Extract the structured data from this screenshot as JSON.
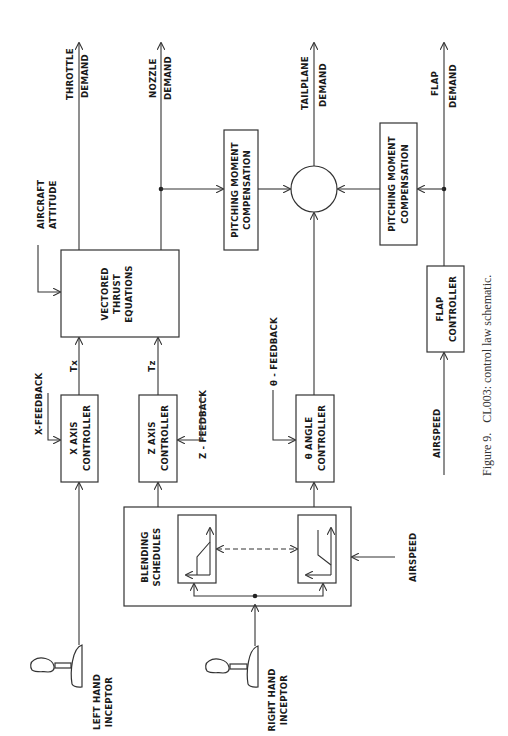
{
  "figure": {
    "caption_number": "Figure 9.",
    "caption_text": "CL003: control law schematic.",
    "orientation": "rotated 90 degrees counter-clockwise"
  },
  "outputs": {
    "throttle": [
      "THROTTLE",
      "DEMAND"
    ],
    "nozzle": [
      "NOZZLE",
      "DEMAND"
    ],
    "tailplane": [
      "TAILPLANE",
      "DEMAND"
    ],
    "flap": [
      "FLAP",
      "DEMAND"
    ]
  },
  "inputs": {
    "aircraft_attitude": [
      "AIRCRAFT",
      "ATTITUDE"
    ],
    "x_feedback": "X-FEEDBACK",
    "z_feedback": "Z - FEEDBACK",
    "theta_feedback": "θ - FEEDBACK",
    "airspeed_blending": "AIRSPEED",
    "airspeed_flap": "AIRSPEED",
    "left_inceptor": [
      "LEFT HAND",
      "INCEPTOR"
    ],
    "right_inceptor": [
      "RIGHT HAND",
      "INCEPTOR"
    ]
  },
  "blocks": {
    "vectored_thrust": [
      "VECTORED",
      "THRUST",
      "EQUATIONS"
    ],
    "x_axis": [
      "X  AXIS",
      "CONTROLLER"
    ],
    "z_axis": [
      "Z  AXIS",
      "CONTROLLER"
    ],
    "theta_angle": [
      "θ ANGLE",
      "CONTROLLER"
    ],
    "flap_controller": [
      "FLAP",
      "CONTROLLER"
    ],
    "pmc_1": [
      "PITCHING MOMENT",
      "COMPENSATION"
    ],
    "pmc_2": [
      "PITCHING MOMENT",
      "COMPENSATION"
    ],
    "blending": [
      "BLENDING",
      "SCHEDULES"
    ],
    "summing_junction": ""
  },
  "signals": {
    "tx": "Tx",
    "tz": "Tz"
  },
  "colors": {
    "line": "#333333",
    "text": "#1a1a1a",
    "background": "#ffffff"
  }
}
